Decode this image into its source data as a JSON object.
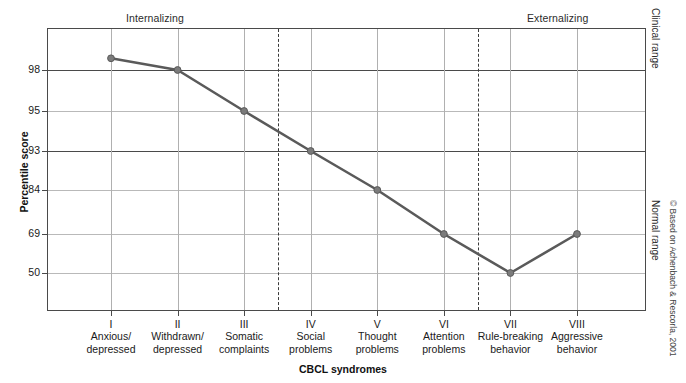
{
  "figure": {
    "top_labels": {
      "internalizing": "Internalizing",
      "externalizing": "Externalizing"
    },
    "side_labels": {
      "clinical_range": "Clinical range",
      "normal_range": "Normal range"
    },
    "credit": "© Based on Achenbach & Rescorla, 2001"
  },
  "chart_data": {
    "type": "line",
    "title": "",
    "xlabel": "CBCL syndromes",
    "ylabel": "Percentile score",
    "categories": [
      "I\nAnxious/\ndepressed",
      "II\nWithdrawn/\ndepressed",
      "III\nSomatic\ncomplaints",
      "IV\nSocial\nproblems",
      "V\nThought\nproblems",
      "VI\nAttention\nproblems",
      "VII\nRule-breaking\nbehavior",
      "VIII\nAggressive\nbehavior"
    ],
    "category_parts": [
      {
        "roman": "I",
        "line1": "Anxious/",
        "line2": "depressed"
      },
      {
        "roman": "II",
        "line1": "Withdrawn/",
        "line2": "depressed"
      },
      {
        "roman": "III",
        "line1": "Somatic",
        "line2": "complaints"
      },
      {
        "roman": "IV",
        "line1": "Social",
        "line2": "problems"
      },
      {
        "roman": "V",
        "line1": "Thought",
        "line2": "problems"
      },
      {
        "roman": "VI",
        "line1": "Attention",
        "line2": "problems"
      },
      {
        "roman": "VII",
        "line1": "Rule-breaking",
        "line2": "behavior"
      },
      {
        "roman": "VIII",
        "line1": "Aggressive",
        "line2": "behavior"
      }
    ],
    "values": [
      99.3,
      98,
      95,
      93,
      84,
      69,
      50,
      69
    ],
    "ytick_labels": [
      "98",
      "95",
      "93",
      "84",
      "69",
      "50"
    ],
    "ytick_values": [
      98,
      95,
      93,
      84,
      69,
      50
    ],
    "ylim": [
      40,
      100
    ],
    "grid": true,
    "legend": "none",
    "series_color": "#5a5a5a",
    "marker_color": "#7b7b7b",
    "dashed_dividers": [
      "between III and IV",
      "between VI and VII"
    ],
    "range_boundary": 93
  }
}
